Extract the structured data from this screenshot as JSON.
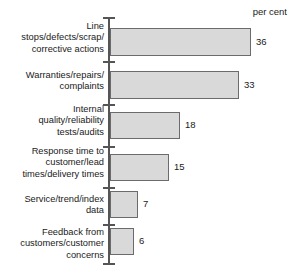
{
  "chart_data": {
    "type": "bar",
    "orientation": "horizontal",
    "title": "",
    "subtitle": "",
    "xlabel": "per cent",
    "ylabel": "",
    "unit_label": "per cent",
    "grid": false,
    "legend": null,
    "xlim": [
      0,
      40
    ],
    "categories": [
      "Line\nstops/defects/scrap/\ncorrective actions",
      "Warranties/repairs/\ncomplaints",
      "Internal\nquality/reliability\ntests/audits",
      "Response time to\ncustomer/lead\ntimes/delivery times",
      "Service/trend/index\ndata",
      "Feedback from\ncustomers/customer\nconcerns"
    ],
    "values": [
      36,
      33,
      18,
      15,
      7,
      6
    ],
    "value_labels": [
      "36",
      "33",
      "18",
      "15",
      "7",
      "6"
    ],
    "colors": {
      "bar_fill": "#d9d9d9",
      "bar_stroke": "#6b6b6b",
      "axis": "#555555",
      "text": "#1a1a1a",
      "background": "#ffffff"
    }
  },
  "rows": [
    {
      "label": "Line\nstops/defects/scrap/\ncorrective actions",
      "value_label": "36",
      "label_top": 21,
      "bar_top": 28,
      "bar_height": 28,
      "bar_width": 141,
      "value_left": 256,
      "value_top": 36,
      "tick_top": 17
    },
    {
      "label": "Warranties/repairs/\ncomplaints",
      "value_label": "33",
      "label_top": 70,
      "bar_top": 71,
      "bar_height": 28,
      "bar_width": 129,
      "value_left": 244,
      "value_top": 79,
      "tick_top": 61
    },
    {
      "label": "Internal\nquality/reliability\ntests/audits",
      "value_label": "18",
      "label_top": 104,
      "bar_top": 112,
      "bar_height": 27,
      "bar_width": 70,
      "value_left": 185,
      "value_top": 119,
      "tick_top": 104
    },
    {
      "label": "Response time to\ncustomer/lead\ntimes/delivery times",
      "value_label": "15",
      "label_top": 146,
      "bar_top": 154,
      "bar_height": 27,
      "bar_width": 59,
      "value_left": 174,
      "value_top": 161,
      "tick_top": 146
    },
    {
      "label": "Service/trend/index\ndata",
      "value_label": "7",
      "label_top": 194,
      "bar_top": 191,
      "bar_height": 27,
      "bar_width": 28,
      "value_left": 143,
      "value_top": 198,
      "tick_top": 187
    },
    {
      "label": "Feedback from\ncustomers/customer\nconcerns",
      "value_label": "6",
      "label_top": 227,
      "bar_top": 228,
      "bar_height": 27,
      "bar_width": 24,
      "value_left": 139,
      "value_top": 235,
      "tick_top": 224
    }
  ],
  "axis": {
    "baseline_tick_top": 263
  }
}
